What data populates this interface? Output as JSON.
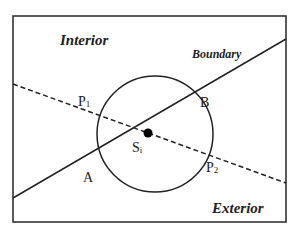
{
  "diagram": {
    "frame": {
      "x": 13,
      "y": 16,
      "width": 273,
      "height": 206,
      "stroke": "#333333"
    },
    "regions": {
      "interior_label": "Interior",
      "exterior_label": "Exterior"
    },
    "boundary": {
      "label": "Boundary",
      "line": {
        "x1": 13,
        "y1": 198,
        "x2": 286,
        "y2": 39
      },
      "style": "solid"
    },
    "ray": {
      "line": {
        "x1": 13,
        "y1": 84,
        "x2": 286,
        "y2": 183
      },
      "style": "dashed"
    },
    "circle": {
      "cx": 155,
      "cy": 134,
      "r": 58
    },
    "center_point": {
      "cx": 148,
      "cy": 133,
      "r": 4.5
    },
    "labels": {
      "P1": {
        "main": "P",
        "sub": "1"
      },
      "P2": {
        "main": "P",
        "sub": "2"
      },
      "A": "A",
      "B": "B",
      "Si": {
        "main": "S",
        "sub": "i"
      }
    }
  }
}
